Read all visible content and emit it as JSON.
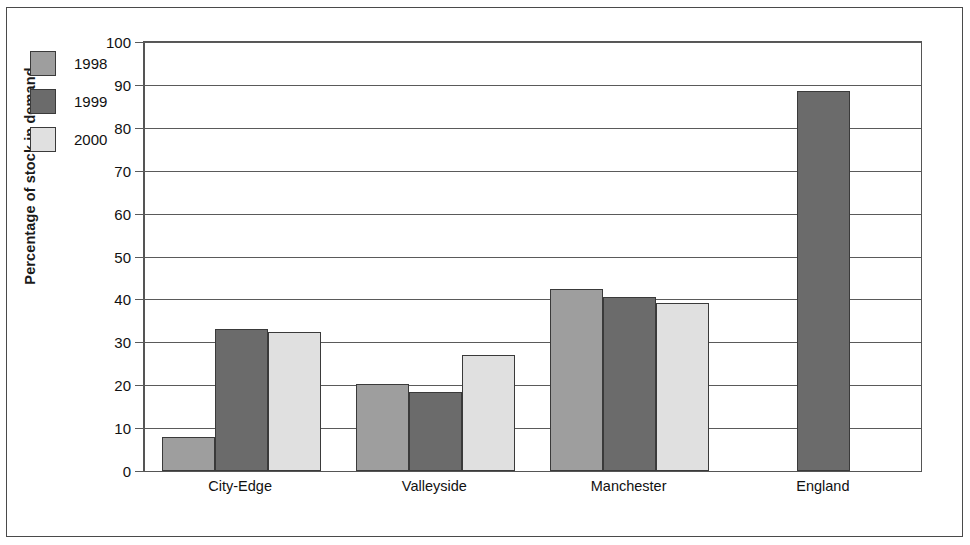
{
  "chart_data": {
    "type": "bar",
    "title": "",
    "xlabel": "",
    "ylabel": "Percentage of stock in demand",
    "ylim": [
      0,
      100
    ],
    "ytick_step": 10,
    "yticks": [
      0,
      10,
      20,
      30,
      40,
      50,
      60,
      70,
      80,
      90,
      100
    ],
    "grid": true,
    "legend_position": "upper-left-inside-plot",
    "categories": [
      "City-Edge",
      "Valleyside",
      "Manchester",
      "England"
    ],
    "series": [
      {
        "name": "1998",
        "color": "#9e9e9e",
        "values": [
          8,
          20.3,
          42.5,
          null
        ]
      },
      {
        "name": "1999",
        "color": "#6b6b6b",
        "values": [
          33,
          18.5,
          40.5,
          88.5
        ]
      },
      {
        "name": "2000",
        "color": "#e0e0e0",
        "values": [
          32.5,
          27,
          39.2,
          null
        ]
      }
    ]
  },
  "colors": {
    "series_1998": "#9e9e9e",
    "series_1999": "#6b6b6b",
    "series_2000": "#e0e0e0",
    "bar_outline": "#3a3a3a",
    "axis": "#555555",
    "grid": "#5a5a5a",
    "frame": "#4a4a4a",
    "text": "#111111",
    "background": "#ffffff"
  },
  "axis": {
    "y_tick_labels": [
      "0",
      "10",
      "20",
      "30",
      "40",
      "50",
      "60",
      "70",
      "80",
      "90",
      "100"
    ],
    "y_title": "Percentage of stock in demand"
  },
  "legend": {
    "items": [
      {
        "label": "1998",
        "color": "#9e9e9e"
      },
      {
        "label": "1999",
        "color": "#6b6b6b"
      },
      {
        "label": "2000",
        "color": "#e0e0e0"
      }
    ]
  }
}
